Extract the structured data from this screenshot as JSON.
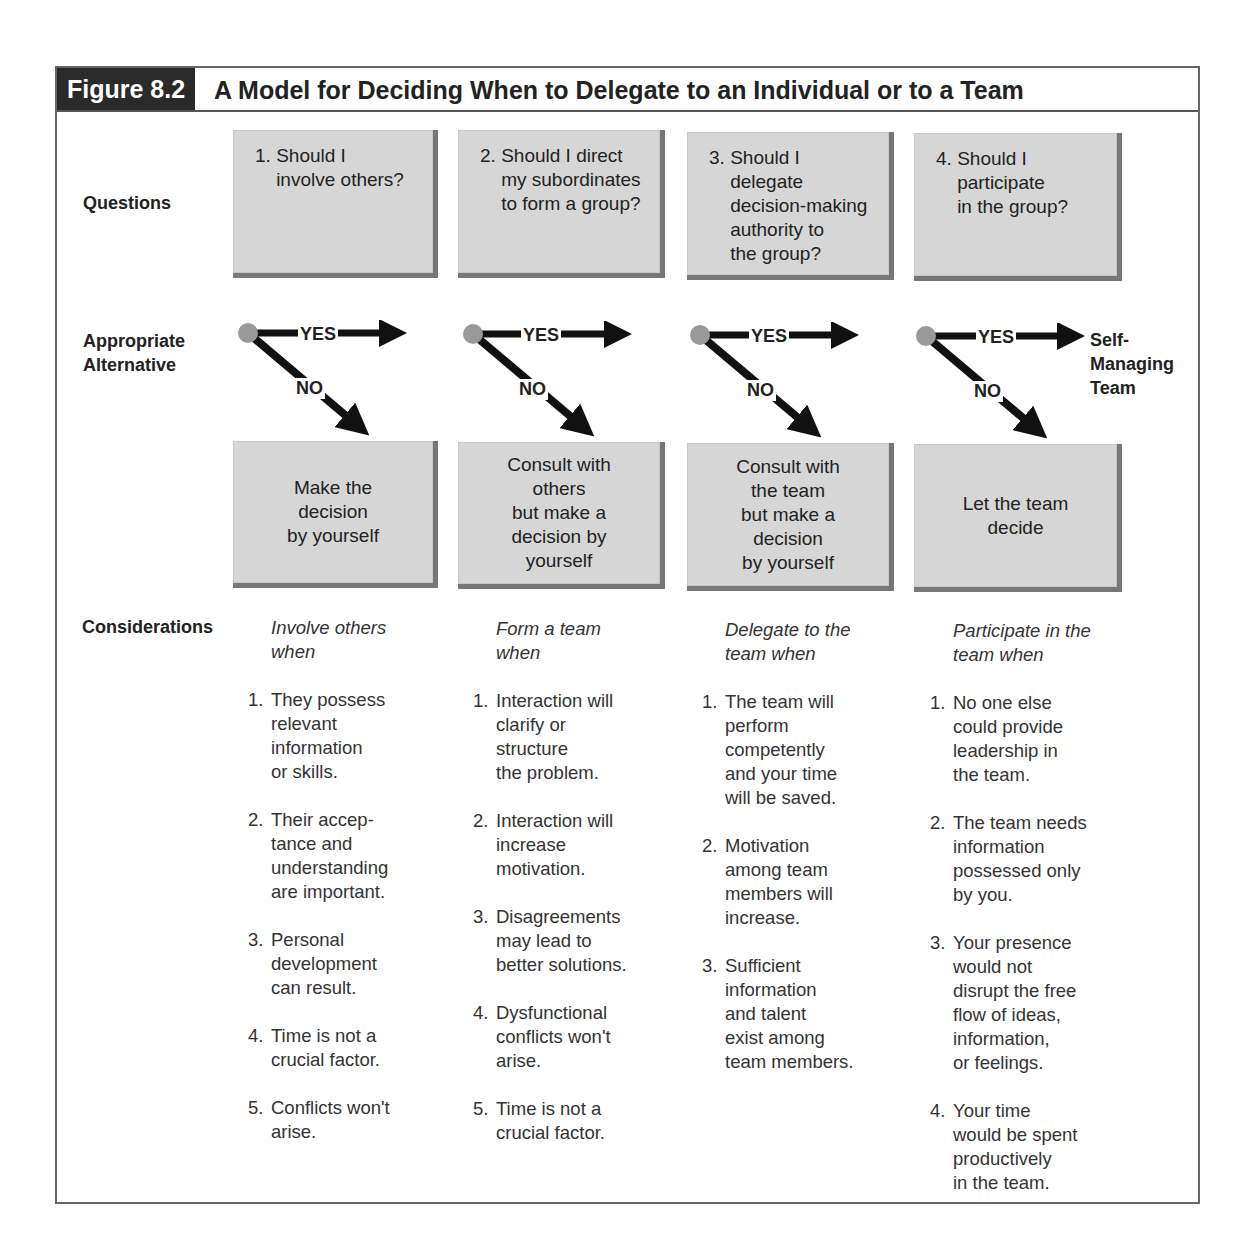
{
  "figure": {
    "label": "Figure 8.2",
    "title": "A Model for Deciding When to Delegate to an Individual or to a Team"
  },
  "row_labels": {
    "questions": "Questions",
    "alternative": "Appropriate\nAlternative",
    "considerations": "Considerations"
  },
  "questions": [
    {
      "num": "1.",
      "text": "Should I\ninvolve others?"
    },
    {
      "num": "2.",
      "text": "Should I direct\nmy subordinates\nto form a group?"
    },
    {
      "num": "3.",
      "text": "Should I\ndelegate\ndecision-making\nauthority to\nthe group?"
    },
    {
      "num": "4.",
      "text": "Should I\nparticipate\nin the group?"
    }
  ],
  "flow": {
    "yes_label": "YES",
    "no_label": "NO",
    "final_yes_outcome": "Self-\nManaging\nTeam"
  },
  "alternatives": [
    "Make the\ndecision\nby yourself",
    "Consult with\nothers\nbut make a\ndecision by\nyourself",
    "Consult with\nthe team\nbut make a\ndecision\nby yourself",
    "Let the team\ndecide"
  ],
  "considerations": [
    {
      "heading": "Involve others\nwhen",
      "items": [
        {
          "num": "1.",
          "text": "They possess\nrelevant\ninformation\nor skills."
        },
        {
          "num": "2.",
          "text": "Their accep-\ntance and\nunderstanding\nare important."
        },
        {
          "num": "3.",
          "text": "Personal\ndevelopment\ncan result."
        },
        {
          "num": "4.",
          "text": "Time is not a\ncrucial factor."
        },
        {
          "num": "5.",
          "text": "Conflicts won't\narise."
        }
      ]
    },
    {
      "heading": "Form a team\nwhen",
      "items": [
        {
          "num": "1.",
          "text": "Interaction will\nclarify or\nstructure\nthe problem."
        },
        {
          "num": "2.",
          "text": "Interaction will\nincrease\nmotivation."
        },
        {
          "num": "3.",
          "text": "Disagreements\nmay lead to\nbetter solutions."
        },
        {
          "num": "4.",
          "text": "Dysfunctional\nconflicts won't\narise."
        },
        {
          "num": "5.",
          "text": "Time is not a\ncrucial factor."
        }
      ]
    },
    {
      "heading": "Delegate to the\nteam when",
      "items": [
        {
          "num": "1.",
          "text": "The team will\nperform\ncompetently\nand your time\nwill be saved."
        },
        {
          "num": "2.",
          "text": "Motivation\namong team\nmembers will\nincrease."
        },
        {
          "num": "3.",
          "text": "Sufficient\ninformation\nand talent\nexist among\nteam members."
        }
      ]
    },
    {
      "heading": "Participate in the\nteam when",
      "items": [
        {
          "num": "1.",
          "text": "No one else\ncould provide\nleadership in\nthe team."
        },
        {
          "num": "2.",
          "text": "The team needs\ninformation\npossessed only\nby you."
        },
        {
          "num": "3.",
          "text": "Your presence\nwould not\ndisrupt the free\nflow of ideas,\ninformation,\nor feelings."
        },
        {
          "num": "4.",
          "text": "Your time\nwould be spent\nproductively\nin the team."
        }
      ]
    }
  ]
}
